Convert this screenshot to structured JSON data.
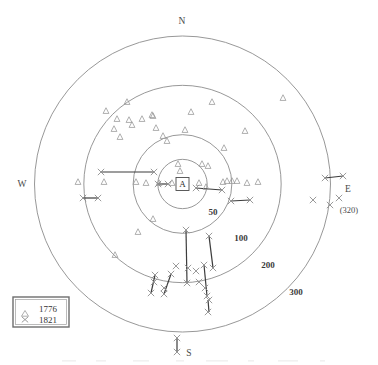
{
  "figure": {
    "title": "",
    "center_label": "A",
    "cardinals": [
      {
        "name": "north",
        "label": "N"
      },
      {
        "name": "east",
        "label": "E"
      },
      {
        "name": "south",
        "label": "S"
      },
      {
        "name": "west",
        "label": "W"
      }
    ],
    "ring_labels": [
      "50",
      "100",
      "200",
      "300"
    ],
    "annotation": "(320)",
    "legend": {
      "entries": [
        {
          "marker": "triangle-icon",
          "label": "1776"
        },
        {
          "marker": "cross-icon",
          "label": "1821"
        }
      ]
    }
  },
  "chart_data": {
    "type": "scatter",
    "projection": "polar",
    "title": "",
    "xlabel": "",
    "ylabel": "",
    "center_label": "A",
    "radial_axis": {
      "label": "distance",
      "ticks": [
        50,
        100,
        200,
        300
      ],
      "tick_labels": [
        "50",
        "100",
        "200",
        "300"
      ],
      "rlim": [
        0,
        320
      ],
      "grid": true
    },
    "angular_axis": {
      "labels": [
        "N",
        "E",
        "S",
        "W"
      ],
      "label_angles_deg": [
        0,
        90,
        180,
        270
      ]
    },
    "legend": {
      "position": "lower-left",
      "entries": [
        "1776",
        "1821"
      ]
    },
    "annotations": [
      {
        "text": "(320)",
        "near": "E",
        "meaning": "outermost point radius"
      }
    ],
    "series": [
      {
        "name": "1776",
        "marker": "triangle",
        "color": "#9a9a9a",
        "points_px": [
          [
            127,
            102
          ],
          [
            106,
            111
          ],
          [
            117,
            119
          ],
          [
            129,
            120
          ],
          [
            153,
            116
          ],
          [
            114,
            129
          ],
          [
            132,
            125
          ],
          [
            152,
            115
          ],
          [
            191,
            112
          ],
          [
            156,
            128
          ],
          [
            120,
            137
          ],
          [
            163,
            136
          ],
          [
            185,
            130
          ],
          [
            167,
            141
          ],
          [
            142,
            119
          ],
          [
            212,
            102
          ],
          [
            283,
            98
          ],
          [
            245,
            131
          ],
          [
            224,
            148
          ],
          [
            202,
            164
          ],
          [
            178,
            164
          ],
          [
            180,
            171
          ],
          [
            208,
            166
          ],
          [
            199,
            183
          ],
          [
            223,
            182
          ],
          [
            227,
            181
          ],
          [
            232,
            181
          ],
          [
            237,
            181
          ],
          [
            247,
            183
          ],
          [
            258,
            182
          ],
          [
            78,
            182
          ],
          [
            104,
            182
          ],
          [
            136,
            182
          ],
          [
            146,
            183
          ],
          [
            159,
            183
          ],
          [
            172,
            183
          ],
          [
            206,
            187
          ],
          [
            153,
            219
          ],
          [
            138,
            232
          ],
          [
            115,
            255
          ]
        ]
      },
      {
        "name": "1821",
        "marker": "cross",
        "color": "#8f8f8f",
        "points_px": [
          [
            101,
            172
          ],
          [
            154,
            172
          ],
          [
            158,
            184
          ],
          [
            168,
            184
          ],
          [
            196,
            188
          ],
          [
            222,
            190
          ],
          [
            231,
            201
          ],
          [
            250,
            200
          ],
          [
            83,
            198
          ],
          [
            98,
            198
          ],
          [
            325,
            178
          ],
          [
            343,
            176
          ],
          [
            330,
            205
          ],
          [
            313,
            200
          ],
          [
            339,
            198
          ],
          [
            186,
            230
          ],
          [
            209,
            236
          ],
          [
            213,
            268
          ],
          [
            176,
            266
          ],
          [
            155,
            275
          ],
          [
            171,
            274
          ],
          [
            196,
            271
          ],
          [
            204,
            265
          ],
          [
            154,
            282
          ],
          [
            164,
            288
          ],
          [
            151,
            293
          ],
          [
            164,
            294
          ],
          [
            199,
            282
          ],
          [
            205,
            288
          ],
          [
            207,
            296
          ],
          [
            187,
            283
          ],
          [
            188,
            268
          ],
          [
            208,
            312
          ],
          [
            209,
            300
          ],
          [
            177,
            338
          ],
          [
            177,
            352
          ]
        ]
      }
    ],
    "segments_px": [
      {
        "x1": 101,
        "y1": 172,
        "x2": 154,
        "y2": 172
      },
      {
        "x1": 158,
        "y1": 184,
        "x2": 168,
        "y2": 184
      },
      {
        "x1": 196,
        "y1": 188,
        "x2": 222,
        "y2": 190
      },
      {
        "x1": 231,
        "y1": 201,
        "x2": 250,
        "y2": 200
      },
      {
        "x1": 83,
        "y1": 198,
        "x2": 98,
        "y2": 198
      },
      {
        "x1": 325,
        "y1": 178,
        "x2": 343,
        "y2": 176
      },
      {
        "x1": 186,
        "y1": 230,
        "x2": 187,
        "y2": 283
      },
      {
        "x1": 209,
        "y1": 236,
        "x2": 213,
        "y2": 268
      },
      {
        "x1": 155,
        "y1": 275,
        "x2": 151,
        "y2": 293
      },
      {
        "x1": 171,
        "y1": 274,
        "x2": 164,
        "y2": 294
      },
      {
        "x1": 204,
        "y1": 265,
        "x2": 207,
        "y2": 296
      },
      {
        "x1": 208,
        "y1": 300,
        "x2": 209,
        "y2": 312
      },
      {
        "x1": 177,
        "y1": 338,
        "x2": 177,
        "y2": 352
      }
    ]
  }
}
